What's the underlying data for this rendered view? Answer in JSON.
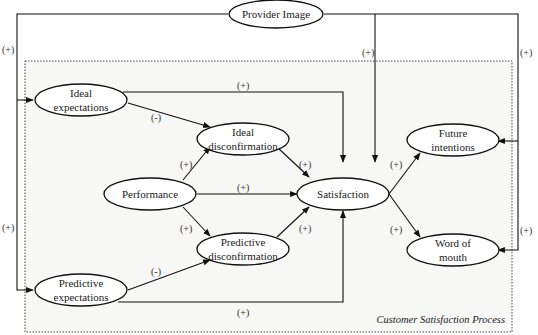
{
  "diagram": {
    "title": "Customer Satisfaction Process",
    "nodes": {
      "provider_image": {
        "label": "Provider Image"
      },
      "ideal_expectations": {
        "line1": "Ideal",
        "line2": "expectations"
      },
      "ideal_disconfirmation": {
        "line1": "Ideal",
        "line2": "disconfirmation"
      },
      "performance": {
        "label": "Performance"
      },
      "predictive_disconfirmation": {
        "line1": "Predictive",
        "line2": "disconfirmation"
      },
      "predictive_expectations": {
        "line1": "Predictive",
        "line2": "expectations"
      },
      "satisfaction": {
        "label": "Satisfaction"
      },
      "future_intentions": {
        "line1": "Future",
        "line2": "intentions"
      },
      "word_of_mouth": {
        "line1": "Word of",
        "line2": "mouth"
      }
    },
    "edges": [
      {
        "from": "Provider Image",
        "to": "Ideal expectations",
        "sign": "(+)"
      },
      {
        "from": "Provider Image",
        "to": "Predictive expectations",
        "sign": "(+)"
      },
      {
        "from": "Provider Image",
        "to": "Satisfaction",
        "sign": "(+)"
      },
      {
        "from": "Provider Image",
        "to": "Future intentions",
        "sign": "(+)"
      },
      {
        "from": "Provider Image",
        "to": "Word of mouth",
        "sign": "(+)"
      },
      {
        "from": "Ideal expectations",
        "to": "Satisfaction",
        "sign": "(+)"
      },
      {
        "from": "Ideal expectations",
        "to": "Ideal disconfirmation",
        "sign": "(-)"
      },
      {
        "from": "Performance",
        "to": "Ideal disconfirmation",
        "sign": "(+)"
      },
      {
        "from": "Performance",
        "to": "Satisfaction",
        "sign": "(+)"
      },
      {
        "from": "Performance",
        "to": "Predictive disconfirmation",
        "sign": "(+)"
      },
      {
        "from": "Ideal disconfirmation",
        "to": "Satisfaction",
        "sign": "(+)"
      },
      {
        "from": "Predictive disconfirmation",
        "to": "Satisfaction",
        "sign": "(+)"
      },
      {
        "from": "Predictive expectations",
        "to": "Predictive disconfirmation",
        "sign": "(-)"
      },
      {
        "from": "Predictive expectations",
        "to": "Satisfaction",
        "sign": "(+)"
      },
      {
        "from": "Satisfaction",
        "to": "Future intentions",
        "sign": "(+)"
      },
      {
        "from": "Satisfaction",
        "to": "Word of mouth",
        "sign": "(+)"
      }
    ],
    "labels": {
      "left_upper": "(+)",
      "left_lower": "(+)",
      "provider_to_sat": "(+)",
      "right_upper": "(+)",
      "right_lower": "(+)",
      "ideal_exp_to_sat": "(+)",
      "ideal_exp_to_disc": "(-)",
      "perf_to_ideal_disc": "(+)",
      "perf_to_sat": "(+)",
      "perf_to_pred_disc": "(+)",
      "ideal_disc_to_sat": "(+)",
      "pred_disc_to_sat": "(+)",
      "pred_exp_to_disc": "(-)",
      "pred_exp_to_sat": "(+)",
      "sat_to_future": "(+)",
      "sat_to_wom": "(+)"
    }
  }
}
